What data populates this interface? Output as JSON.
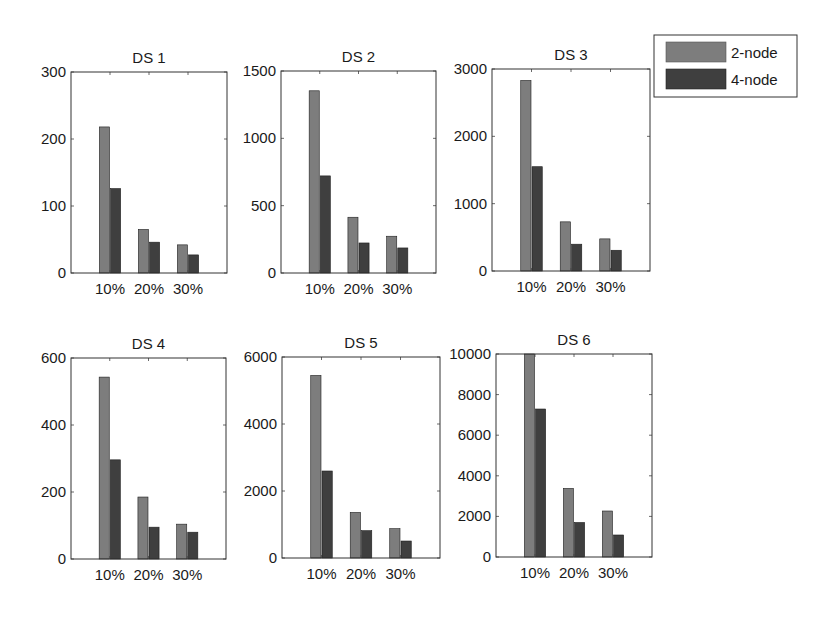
{
  "chart_data": [
    {
      "type": "bar",
      "title": "DS 1",
      "categories": [
        "10%",
        "20%",
        "30%"
      ],
      "series": [
        {
          "name": "2-node",
          "values": [
            218,
            65,
            42
          ]
        },
        {
          "name": "4-node",
          "values": [
            126,
            46,
            27
          ]
        }
      ],
      "ylim": [
        0,
        300
      ],
      "yticks": [
        0,
        100,
        200,
        300
      ],
      "xlabel": "",
      "ylabel": "",
      "grid": false
    },
    {
      "type": "bar",
      "title": "DS 2",
      "categories": [
        "10%",
        "20%",
        "30%"
      ],
      "series": [
        {
          "name": "2-node",
          "values": [
            1353,
            414,
            273
          ]
        },
        {
          "name": "4-node",
          "values": [
            721,
            223,
            186
          ]
        }
      ],
      "ylim": [
        0,
        1500
      ],
      "yticks": [
        0,
        500,
        1000,
        1500
      ],
      "xlabel": "",
      "ylabel": "",
      "grid": false
    },
    {
      "type": "bar",
      "title": "DS 3",
      "categories": [
        "10%",
        "20%",
        "30%"
      ],
      "series": [
        {
          "name": "2-node",
          "values": [
            2830,
            730,
            477
          ]
        },
        {
          "name": "4-node",
          "values": [
            1549,
            398,
            308
          ]
        }
      ],
      "ylim": [
        0,
        3000
      ],
      "yticks": [
        0,
        1000,
        2000,
        3000
      ],
      "xlabel": "",
      "ylabel": "",
      "grid": false
    },
    {
      "type": "bar",
      "title": "DS 4",
      "categories": [
        "10%",
        "20%",
        "30%"
      ],
      "series": [
        {
          "name": "2-node",
          "values": [
            543,
            185,
            104
          ]
        },
        {
          "name": "4-node",
          "values": [
            296,
            95,
            80
          ]
        }
      ],
      "ylim": [
        0,
        600
      ],
      "yticks": [
        0,
        200,
        400,
        600
      ],
      "xlabel": "",
      "ylabel": "",
      "grid": false
    },
    {
      "type": "bar",
      "title": "DS 5",
      "categories": [
        "10%",
        "20%",
        "30%"
      ],
      "series": [
        {
          "name": "2-node",
          "values": [
            5450,
            1361,
            875
          ]
        },
        {
          "name": "4-node",
          "values": [
            2597,
            815,
            507
          ]
        }
      ],
      "ylim": [
        0,
        6000
      ],
      "yticks": [
        0,
        2000,
        4000,
        6000
      ],
      "xlabel": "",
      "ylabel": "",
      "grid": false
    },
    {
      "type": "bar",
      "title": "DS 6",
      "categories": [
        "10%",
        "20%",
        "30%"
      ],
      "series": [
        {
          "name": "2-node",
          "values": [
            10000,
            3380,
            2266
          ]
        },
        {
          "name": "4-node",
          "values": [
            7290,
            1700,
            1084
          ]
        }
      ],
      "ylim": [
        0,
        10000
      ],
      "yticks": [
        0,
        2000,
        4000,
        6000,
        8000,
        10000
      ],
      "xlabel": "",
      "ylabel": "",
      "grid": false
    }
  ],
  "legend": {
    "position": "top-right",
    "entries": [
      {
        "label": "2-node",
        "color": "#7d7d7d"
      },
      {
        "label": "4-node",
        "color": "#3f3f3f"
      }
    ]
  },
  "colors": {
    "series_0": "#7d7d7d",
    "series_1": "#3f3f3f",
    "edge": "#1e1e1e",
    "axis": "#333333"
  }
}
